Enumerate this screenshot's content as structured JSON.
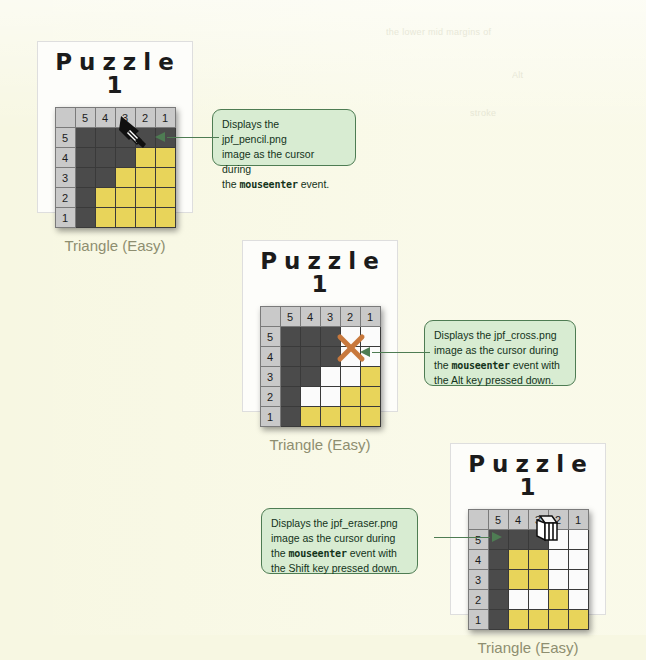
{
  "page": {
    "background_color": "#f7f7e2",
    "ghost_text": [
      "the lower mid margins of",
      "Alt",
      "stroke"
    ]
  },
  "colors": {
    "card_bg": "#fdfdfa",
    "cell_dark": "#4b4b4b",
    "cell_white": "#fbfbfb",
    "cell_yellow": "#e8d45a",
    "header_gray": "#c9c9c9",
    "callout_bg": "#d8ecd2",
    "callout_border": "#4e7c53",
    "caption_color": "#8e8e70",
    "cross_cursor": "#c8783c"
  },
  "puzzles": [
    {
      "title": "Puzzle 1",
      "caption": "Triangle (Easy)",
      "col_headers": [
        "",
        "5",
        "4",
        "3",
        "2",
        "1"
      ],
      "row_headers": [
        "5",
        "4",
        "3",
        "2",
        "1"
      ],
      "cells": [
        [
          "dark",
          "dark",
          "dark",
          "dark",
          "dark"
        ],
        [
          "dark",
          "dark",
          "dark",
          "yellow",
          "yellow"
        ],
        [
          "dark",
          "dark",
          "yellow",
          "yellow",
          "yellow"
        ],
        [
          "dark",
          "yellow",
          "yellow",
          "yellow",
          "yellow"
        ],
        [
          "dark",
          "yellow",
          "yellow",
          "yellow",
          "yellow"
        ]
      ],
      "cursor": "pencil-cursor"
    },
    {
      "title": "Puzzle 1",
      "caption": "Triangle (Easy)",
      "col_headers": [
        "",
        "5",
        "4",
        "3",
        "2",
        "1"
      ],
      "row_headers": [
        "5",
        "4",
        "3",
        "2",
        "1"
      ],
      "cells": [
        [
          "dark",
          "dark",
          "dark",
          "white",
          "white"
        ],
        [
          "dark",
          "dark",
          "dark",
          "white",
          "white"
        ],
        [
          "dark",
          "dark",
          "white",
          "white",
          "yellow"
        ],
        [
          "dark",
          "white",
          "white",
          "yellow",
          "yellow"
        ],
        [
          "dark",
          "yellow",
          "yellow",
          "yellow",
          "yellow"
        ]
      ],
      "cursor": "cross-cursor"
    },
    {
      "title": "Puzzle 1",
      "caption": "Triangle (Easy)",
      "col_headers": [
        "",
        "5",
        "4",
        "3",
        "2",
        "1"
      ],
      "row_headers": [
        "5",
        "4",
        "3",
        "2",
        "1"
      ],
      "cells": [
        [
          "dark",
          "dark",
          "dark",
          "white",
          "white"
        ],
        [
          "dark",
          "yellow",
          "yellow",
          "white",
          "white"
        ],
        [
          "dark",
          "yellow",
          "yellow",
          "white",
          "white"
        ],
        [
          "dark",
          "white",
          "white",
          "yellow",
          "white"
        ],
        [
          "dark",
          "yellow",
          "yellow",
          "yellow",
          "yellow"
        ]
      ],
      "cursor": "eraser-cursor"
    }
  ],
  "callouts": [
    {
      "id": "callout-pencil",
      "line1": "Displays the jpf_pencil.png",
      "line2": "image as the cursor during",
      "line3_pre": "the ",
      "line3_mono": "mouseenter",
      "line3_post": " event.",
      "line4_pre": "",
      "line4_post": ""
    },
    {
      "id": "callout-cross",
      "line1": "Displays the jpf_cross.png",
      "line2": "image as the cursor during",
      "line3_pre": "the ",
      "line3_mono": "mouseenter",
      "line3_post": " event with",
      "line4_pre": "the Alt key pressed down.",
      "line4_post": ""
    },
    {
      "id": "callout-eraser",
      "line1": "Displays the jpf_eraser.png",
      "line2": "image as the cursor during",
      "line3_pre": "the ",
      "line3_mono": "mouseenter",
      "line3_post": " event with",
      "line4_pre": "the Shift key pressed down.",
      "line4_post": ""
    }
  ]
}
